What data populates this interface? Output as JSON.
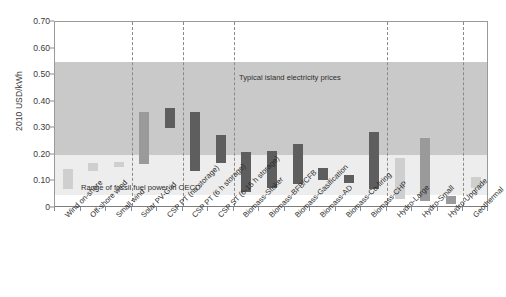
{
  "chart_data": {
    "type": "bar",
    "subtype": "floating-range-bar",
    "title": "",
    "xlabel": "",
    "ylabel": "2010 USD/kWh",
    "ylim": [
      0,
      0.7
    ],
    "yticks": [
      "0",
      "0.10",
      "0.20",
      "0.30",
      "0.40",
      "0.50",
      "0.60",
      "0.70"
    ],
    "ytick_values": [
      0,
      0.1,
      0.2,
      0.3,
      0.4,
      0.5,
      0.6,
      0.7
    ],
    "grid": false,
    "legend": "none",
    "categories": [
      "Wind on-shore",
      "Off-shore wind",
      "Small wind",
      "Solar PV-Grid",
      "CSP PT (no storage)",
      "CSP PT (6 h storage)",
      "CSP ST (6-15 h storage)",
      "Biomass-Stoker",
      "Biomass-BFB/CFB",
      "Biomass-Gasification",
      "Biomass-AD",
      "Biomass-Co-firing",
      "Biomass-CHP",
      "Hydro-Large",
      "Hydro-Small",
      "Hydro-Upgrade",
      "Geothermal"
    ],
    "series": [
      {
        "name": "Levelised cost range",
        "low": [
          0.07,
          0.14,
          0.155,
          0.165,
          0.3,
          0.14,
          0.17,
          0.06,
          0.075,
          0.09,
          0.105,
          0.095,
          0.07,
          0.035,
          0.025,
          0.015,
          0.075
        ],
        "high": [
          0.145,
          0.17,
          0.175,
          0.36,
          0.375,
          0.36,
          0.275,
          0.21,
          0.215,
          0.24,
          0.15,
          0.125,
          0.285,
          0.19,
          0.265,
          0.045,
          0.115
        ],
        "shades": [
          "light",
          "light",
          "light",
          "medium",
          "dark",
          "dark",
          "dark",
          "dark",
          "dark",
          "dark",
          "dark",
          "dark",
          "dark",
          "light",
          "medium",
          "medium",
          "light"
        ]
      }
    ],
    "bands": [
      {
        "name": "Typical island electricity prices",
        "from": 0.2,
        "to": 0.55,
        "color": "#c9c9c9",
        "label": "Typical island electricity prices"
      },
      {
        "name": "Range of fossil fuel power in OECD",
        "from": 0.05,
        "to": 0.2,
        "color": "#ededed",
        "label": "Range of fossil fuel power in OECD"
      }
    ],
    "dividers_after": [
      "Small wind",
      "CSP PT (no storage)",
      "CSP ST (6-15 h storage)",
      "Biomass-CHP",
      "Hydro-Upgrade"
    ],
    "colors": {
      "bar_light": "#cfcfcf",
      "bar_medium": "#9a9a9a",
      "bar_dark": "#5e5e5e",
      "band_island": "#c9c9c9",
      "band_fossil": "#ededed",
      "axis": "#8c8c8c",
      "text": "#2b2b2b"
    }
  }
}
